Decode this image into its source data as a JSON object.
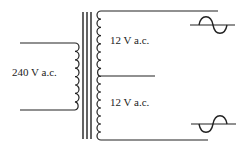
{
  "diagram": {
    "type": "transformer-schematic",
    "primary": {
      "label": "240 V a.c."
    },
    "secondary": {
      "upper_label": "12 V a.c.",
      "lower_label": "12 V a.c."
    },
    "symbols": {
      "top_output": "ac-sine-icon",
      "bottom_output": "ac-sine-icon"
    },
    "colors": {
      "stroke": "#222222",
      "background": "#ffffff"
    }
  }
}
